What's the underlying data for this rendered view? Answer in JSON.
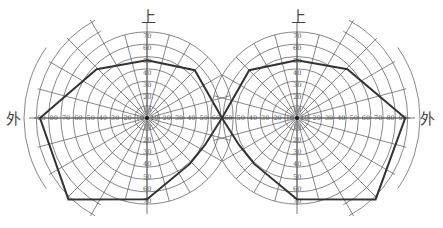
{
  "chart_data": {
    "type": "polar-perimetry",
    "title": "",
    "labels": {
      "top": "上",
      "outer": "外"
    },
    "ring_step_deg": 10,
    "ring_labels": [
      10,
      20,
      30,
      40,
      50,
      60,
      70,
      80,
      90
    ],
    "vertical_ring_labels": [
      10,
      20,
      30,
      40,
      50,
      60,
      70
    ],
    "meridian_step_deg": 15,
    "charts": [
      {
        "name": "left-eye",
        "center_px": [
          147,
          118
        ],
        "outer_side": "left",
        "field_vertices_deg": [
          {
            "angle": 90,
            "r": 47
          },
          {
            "angle": 45,
            "r": 55
          },
          {
            "angle": 0,
            "r": 61
          },
          {
            "angle": -25,
            "r": 52
          },
          {
            "angle": -47,
            "r": 51
          },
          {
            "angle": -90,
            "r": 66
          },
          {
            "angle": -134,
            "r": 92
          },
          {
            "angle": 180,
            "r": 87
          },
          {
            "angle": 136,
            "r": 57
          }
        ]
      },
      {
        "name": "right-eye",
        "center_px": [
          297,
          118
        ],
        "outer_side": "right",
        "field_vertices_deg": [
          {
            "angle": 90,
            "r": 47
          },
          {
            "angle": 135,
            "r": 55
          },
          {
            "angle": 180,
            "r": 61
          },
          {
            "angle": -155,
            "r": 52
          },
          {
            "angle": -133,
            "r": 51
          },
          {
            "angle": -90,
            "r": 66
          },
          {
            "angle": -46,
            "r": 92
          },
          {
            "angle": 0,
            "r": 88
          },
          {
            "angle": 44,
            "r": 57
          }
        ]
      }
    ]
  }
}
